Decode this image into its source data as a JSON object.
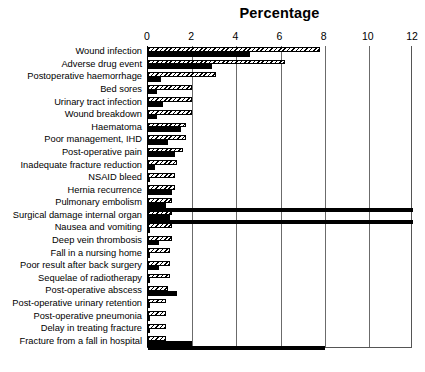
{
  "chart_data": {
    "type": "bar",
    "orientation": "horizontal",
    "title": "Percentage",
    "xlabel": "",
    "ylabel": "",
    "xlim": [
      0,
      12
    ],
    "xticks": [
      0,
      2,
      4,
      6,
      8,
      10,
      12
    ],
    "grid": true,
    "legend": null,
    "series": [
      {
        "name": "hatched",
        "style": "diagonal-hatch",
        "values": [
          7.8,
          6.2,
          3.1,
          2.0,
          2.0,
          2.0,
          1.7,
          1.7,
          1.6,
          1.3,
          1.2,
          1.2,
          1.1,
          1.1,
          1.1,
          1.1,
          1.0,
          1.0,
          1.0,
          0.9,
          0.8,
          0.8,
          0.8,
          0.8
        ]
      },
      {
        "name": "solid",
        "style": "solid-black",
        "values": [
          4.6,
          2.9,
          0.6,
          0.4,
          0.7,
          0.4,
          1.5,
          0.9,
          1.2,
          0.3,
          0.1,
          1.1,
          0.8,
          1.0,
          0.1,
          0.5,
          0.1,
          0.5,
          0.1,
          1.3,
          0.1,
          0.1,
          0.1,
          2.0
        ]
      }
    ],
    "categories": [
      "Wound infection",
      "Adverse drug event",
      "Postoperative haemorrhage",
      "Bed sores",
      "Urinary tract infection",
      "Wound breakdown",
      "Haematoma",
      "Poor management, IHD",
      "Post-operative pain",
      "Inadequate fracture reduction",
      "NSAID bleed",
      "Hernia recurrence",
      "Pulmonary embolism",
      "Surgical damage internal organ",
      "Nausea and vomiting",
      "Deep vein thrombosis",
      "Fall in a nursing home",
      "Poor result after back surgery",
      "Sequelae of radiotherapy",
      "Post-operative abscess",
      "Post-operative urinary retention",
      "Post-operative pneumonia",
      "Delay in treating fracture",
      "Fracture from a fall in hospital"
    ],
    "separator_rules": [
      {
        "after_category": "Pulmonary embolism",
        "extent": 12
      },
      {
        "after_category": "Surgical damage internal organ",
        "extent": 12
      },
      {
        "after_category": "Fracture from a fall in hospital",
        "extent": 8
      }
    ],
    "colors": {
      "bar_solid": "#000000",
      "bar_hatch_line": "#000000",
      "bar_hatch_fill": "#ffffff",
      "gridline": "#6b6b6b",
      "axis": "#000000",
      "background": "#ffffff",
      "text": "#000000"
    }
  }
}
